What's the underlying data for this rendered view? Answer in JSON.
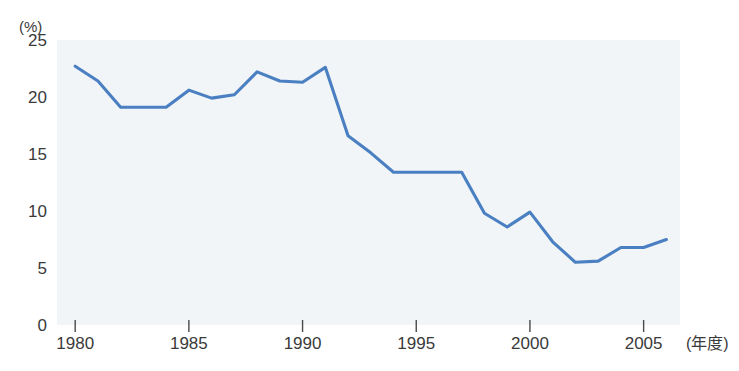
{
  "chart_data": {
    "type": "line",
    "title": "",
    "subtitle": "",
    "xlabel": "(年度)",
    "ylabel": "(%)",
    "yunit": "(%)",
    "xlim": [
      1979.2,
      2006.6
    ],
    "ylim": [
      0,
      25
    ],
    "grid": false,
    "legend": false,
    "legend_position": "none",
    "line_color": "#4a7fc1",
    "plot_background": "#f1f5f8",
    "y_ticks": [
      0,
      5,
      10,
      15,
      20,
      25
    ],
    "y_tick_labels": [
      "0",
      "5",
      "10",
      "15",
      "20",
      "25"
    ],
    "x_ticks": [
      1980,
      1985,
      1990,
      1995,
      2000,
      2005
    ],
    "x_tick_labels": [
      "1980",
      "1985",
      "1990",
      "1995",
      "2000",
      "2005"
    ],
    "x": [
      1980,
      1981,
      1982,
      1983,
      1984,
      1985,
      1986,
      1987,
      1988,
      1989,
      1990,
      1991,
      1992,
      1993,
      1994,
      1995,
      1996,
      1997,
      1998,
      1999,
      2000,
      2001,
      2002,
      2003,
      2004,
      2005,
      2006
    ],
    "values": [
      22.7,
      21.4,
      19.1,
      19.1,
      19.1,
      20.6,
      19.9,
      20.2,
      22.2,
      21.4,
      21.3,
      22.6,
      16.6,
      15.1,
      13.4,
      13.4,
      13.4,
      13.4,
      9.8,
      8.6,
      9.9,
      7.3,
      5.5,
      5.6,
      6.8,
      6.8,
      7.5
    ],
    "series": [
      {
        "name": "",
        "color": "#4a7fc1",
        "values": [
          22.7,
          21.4,
          19.1,
          19.1,
          19.1,
          20.6,
          19.9,
          20.2,
          22.2,
          21.4,
          21.3,
          22.6,
          16.6,
          15.1,
          13.4,
          13.4,
          13.4,
          13.4,
          9.8,
          8.6,
          9.9,
          7.3,
          5.5,
          5.6,
          6.8,
          6.8,
          7.5
        ]
      }
    ]
  }
}
